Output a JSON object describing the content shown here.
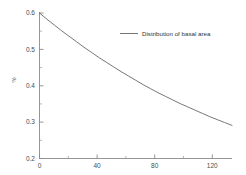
{
  "chart_data": {
    "type": "line",
    "title": "",
    "subtitle": "",
    "xlabel": "",
    "ylabel": "%",
    "xlim": [
      0,
      130
    ],
    "ylim": [
      0.2,
      0.6
    ],
    "grid": false,
    "legend_position": "top-right",
    "x_ticks": [
      0,
      40,
      80,
      120
    ],
    "x_tick_labels": [
      "0",
      "40",
      "80",
      "120"
    ],
    "x_minor_ticks": [
      20,
      60,
      100
    ],
    "y_ticks": [
      0.2,
      0.3,
      0.4,
      0.5,
      0.6
    ],
    "y_tick_labels": [
      "0.2",
      "0.3",
      "0.4",
      "0.5",
      "0.6"
    ],
    "y_minor_ticks": [
      0.25,
      0.35,
      0.45,
      0.55
    ],
    "series": [
      {
        "name": "Distribution of basal area",
        "color": "#666666",
        "x": [
          0,
          5,
          10,
          15,
          20,
          25,
          30,
          35,
          40,
          45,
          50,
          55,
          60,
          65,
          70,
          75,
          80,
          85,
          90,
          95,
          100,
          105,
          110,
          115,
          120,
          125,
          130
        ],
        "values": [
          0.6,
          0.583,
          0.567,
          0.551,
          0.536,
          0.521,
          0.506,
          0.492,
          0.478,
          0.465,
          0.452,
          0.439,
          0.427,
          0.415,
          0.403,
          0.392,
          0.381,
          0.371,
          0.361,
          0.351,
          0.342,
          0.333,
          0.324,
          0.315,
          0.307,
          0.299,
          0.291
        ]
      }
    ]
  },
  "legend": {
    "entries": [
      {
        "label": "Distribution of basal area"
      }
    ]
  },
  "axes": {
    "y_axis_title": "%",
    "x_tick_0": "0",
    "x_tick_1": "40",
    "x_tick_2": "80",
    "x_tick_3": "120",
    "y_tick_0": "0.2",
    "y_tick_1": "0.3",
    "y_tick_2": "0.4",
    "y_tick_3": "0.5",
    "y_tick_4": "0.6"
  }
}
